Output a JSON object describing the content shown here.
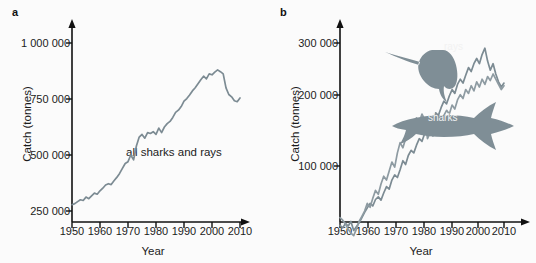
{
  "figure": {
    "panels": [
      {
        "letter": "a",
        "xlabel": "Year",
        "ylabel": "Catch (tonnes)",
        "annotation": "all sharks and rays",
        "yticks": [
          "250 000",
          "500 000",
          "750 000",
          "1 000 000"
        ],
        "xticks": [
          "1950",
          "1960",
          "1970",
          "1980",
          "1990",
          "2000",
          "2010"
        ]
      },
      {
        "letter": "b",
        "xlabel": "Year",
        "ylabel": "Catch (tonnes)",
        "yticks": [
          "100 000",
          "200 000",
          "300 000"
        ],
        "xticks": [
          "1950",
          "1960",
          "1970",
          "1980",
          "1990",
          "2000",
          "2010"
        ],
        "series_labels": {
          "rays": "rays",
          "sharks": "sharks"
        }
      }
    ],
    "colors": {
      "line": "#7c8b93",
      "axis": "#111111",
      "text": "#1b1b1b",
      "silhouette": "#7f8e96",
      "silhouette_label": "#f2f2f2",
      "background": "#fbfbfb"
    }
  },
  "chart_data": [
    {
      "type": "line",
      "title": "",
      "panel": "a",
      "xlabel": "Year",
      "ylabel": "Catch (tonnes)",
      "xlim": [
        1950,
        2010
      ],
      "ylim": [
        250000,
        1000000
      ],
      "ytick_values": [
        250000,
        500000,
        750000,
        1000000
      ],
      "xtick_values": [
        1950,
        1960,
        1970,
        1980,
        1990,
        2000,
        2010
      ],
      "grid": false,
      "legend": "none",
      "annotations": [
        {
          "text": "all sharks and rays",
          "x": 1980,
          "y": 430000
        }
      ],
      "series": [
        {
          "name": "all sharks and rays",
          "x": [
            1950,
            1951,
            1952,
            1953,
            1954,
            1955,
            1956,
            1957,
            1958,
            1959,
            1960,
            1961,
            1962,
            1963,
            1964,
            1965,
            1966,
            1967,
            1968,
            1969,
            1970,
            1971,
            1972,
            1973,
            1974,
            1975,
            1976,
            1977,
            1978,
            1979,
            1980,
            1981,
            1982,
            1983,
            1984,
            1985,
            1986,
            1987,
            1988,
            1989,
            1990,
            1991,
            1992,
            1993,
            1994,
            1995,
            1996,
            1997,
            1998,
            1999,
            2000,
            2001,
            2002,
            2003,
            2004,
            2005,
            2006,
            2007,
            2008,
            2009,
            2010
          ],
          "values": [
            278000,
            283000,
            292000,
            300000,
            297000,
            312000,
            305000,
            318000,
            330000,
            325000,
            340000,
            352000,
            366000,
            372000,
            368000,
            385000,
            400000,
            418000,
            440000,
            462000,
            470000,
            500000,
            478000,
            540000,
            580000,
            592000,
            575000,
            600000,
            596000,
            604000,
            592000,
            620000,
            600000,
            625000,
            640000,
            650000,
            668000,
            690000,
            700000,
            716000,
            740000,
            752000,
            768000,
            786000,
            800000,
            818000,
            836000,
            852000,
            840000,
            862000,
            858000,
            870000,
            880000,
            872000,
            862000,
            800000,
            770000,
            760000,
            742000,
            738000,
            755000
          ]
        }
      ]
    },
    {
      "type": "line",
      "title": "",
      "panel": "b",
      "xlabel": "Year",
      "ylabel": "Catch (tonnes)",
      "xlim": [
        1950,
        2010
      ],
      "ylim": [
        0,
        300000
      ],
      "ytick_values": [
        100000,
        200000,
        300000
      ],
      "xtick_values": [
        1950,
        1960,
        1970,
        1980,
        1990,
        2000,
        2010
      ],
      "grid": false,
      "legend": "inline-silhouette-labels",
      "annotations": [
        {
          "text": "rays",
          "x": 1988,
          "y": 258000
        },
        {
          "text": "sharks",
          "x": 1998,
          "y": 148000
        }
      ],
      "series": [
        {
          "name": "rays",
          "x": [
            1950,
            1951,
            1952,
            1953,
            1954,
            1955,
            1956,
            1957,
            1958,
            1959,
            1960,
            1961,
            1962,
            1963,
            1964,
            1965,
            1966,
            1967,
            1968,
            1969,
            1970,
            1971,
            1972,
            1973,
            1974,
            1975,
            1976,
            1977,
            1978,
            1979,
            1980,
            1981,
            1982,
            1983,
            1984,
            1985,
            1986,
            1987,
            1988,
            1989,
            1990,
            1991,
            1992,
            1993,
            1994,
            1995,
            1996,
            1997,
            1998,
            1999,
            2000,
            2001,
            2002,
            2003,
            2004,
            2005,
            2006,
            2007,
            2008,
            2009,
            2010
          ],
          "values": [
            18000,
            14000,
            21000,
            17000,
            24000,
            10000,
            16000,
            22000,
            30000,
            38000,
            45000,
            52000,
            48000,
            58000,
            62000,
            57000,
            68000,
            78000,
            74000,
            88000,
            96000,
            92000,
            104000,
            118000,
            112000,
            126000,
            134000,
            130000,
            142000,
            152000,
            148000,
            160000,
            172000,
            168000,
            180000,
            192000,
            188000,
            200000,
            210000,
            206000,
            218000,
            228000,
            222000,
            236000,
            244000,
            238000,
            250000,
            262000,
            256000,
            268000,
            276000,
            268000,
            282000,
            292000,
            272000,
            258000,
            268000,
            252000,
            240000,
            232000,
            238000
          ]
        },
        {
          "name": "sharks",
          "x": [
            1950,
            1951,
            1952,
            1953,
            1954,
            1955,
            1956,
            1957,
            1958,
            1959,
            1960,
            1961,
            1962,
            1963,
            1964,
            1965,
            1966,
            1967,
            1968,
            1969,
            1970,
            1971,
            1972,
            1973,
            1974,
            1975,
            1976,
            1977,
            1978,
            1979,
            1980,
            1981,
            1982,
            1983,
            1984,
            1985,
            1986,
            1987,
            1988,
            1989,
            1990,
            1991,
            1992,
            1993,
            1994,
            1995,
            1996,
            1997,
            1998,
            1999,
            2000,
            2001,
            2002,
            2003,
            2004,
            2005,
            2006,
            2007,
            2008,
            2009,
            2010
          ],
          "values": [
            30000,
            26000,
            20000,
            12000,
            6000,
            2000,
            12000,
            24000,
            32000,
            40000,
            52000,
            46000,
            60000,
            72000,
            66000,
            82000,
            94000,
            88000,
            102000,
            116000,
            108000,
            130000,
            146000,
            138000,
            152000,
            168000,
            160000,
            176000,
            184000,
            178000,
            190000,
            182000,
            152000,
            162000,
            156000,
            170000,
            180000,
            174000,
            188000,
            196000,
            190000,
            204000,
            198000,
            212000,
            220000,
            214000,
            228000,
            222000,
            234000,
            226000,
            240000,
            232000,
            244000,
            236000,
            248000,
            242000,
            252000,
            244000,
            236000,
            228000,
            234000
          ]
        }
      ]
    }
  ]
}
